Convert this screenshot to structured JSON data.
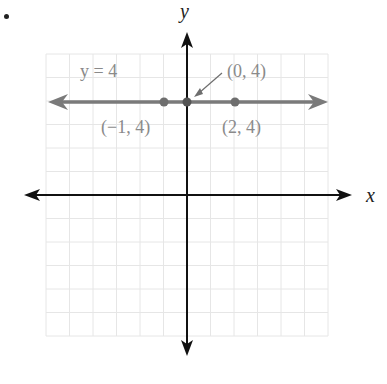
{
  "figure": {
    "bullet": "•",
    "axes": {
      "x_label": "x",
      "y_label": "y"
    },
    "line": {
      "equation_label": "y = 4",
      "color": "#7a7a7a"
    },
    "points": [
      {
        "label": "(−1, 4)",
        "x": -1,
        "y": 4
      },
      {
        "label": "(0, 4)",
        "x": 0,
        "y": 4
      },
      {
        "label": "(2, 4)",
        "x": 2,
        "y": 4
      }
    ],
    "colors": {
      "axis": "#111111",
      "grid": "#e6e6e6",
      "line": "#7a7a7a",
      "point": "#6e6e6e",
      "label": "#8a8a8a"
    }
  },
  "chart_data": {
    "type": "line",
    "title": "",
    "xlabel": "x",
    "ylabel": "y",
    "series": [
      {
        "name": "y = 4",
        "x": [
          -6,
          6
        ],
        "y": [
          4,
          4
        ]
      }
    ],
    "points": [
      {
        "label": "(-1, 4)",
        "x": -1,
        "y": 4
      },
      {
        "label": "(0, 4)",
        "x": 0,
        "y": 4
      },
      {
        "label": "(2, 4)",
        "x": 2,
        "y": 4
      }
    ],
    "xlim": [
      -6,
      6
    ],
    "ylim": [
      -6,
      6
    ],
    "grid": true,
    "tick_labels": false
  }
}
